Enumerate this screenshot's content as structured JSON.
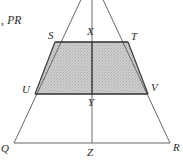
{
  "figure": {
    "caption_fragment": ", PR",
    "type": "geometric-diagram",
    "colors": {
      "stroke": "#555555",
      "stroke_heavy": "#333333",
      "shade_fill": "#c9c9c9",
      "label_color": "#2b2b2b",
      "background": "#ffffff"
    },
    "labels": {
      "S": "S",
      "X": "X",
      "T": "T",
      "U": "U",
      "Y": "Y",
      "V": "V",
      "Q": "Q",
      "Z": "Z",
      "R": "R"
    },
    "points": {
      "apex": {
        "x": 92,
        "y": -20
      },
      "S": {
        "x": 55,
        "y": 42
      },
      "X": {
        "x": 92,
        "y": 42
      },
      "T": {
        "x": 128,
        "y": 42
      },
      "U": {
        "x": 35,
        "y": 94
      },
      "Y": {
        "x": 92,
        "y": 94
      },
      "V": {
        "x": 148,
        "y": 94
      },
      "Q": {
        "x": 14,
        "y": 143
      },
      "Z": {
        "x": 92,
        "y": 143
      },
      "R": {
        "x": 170,
        "y": 143
      }
    },
    "shaded_region": "STVU"
  }
}
